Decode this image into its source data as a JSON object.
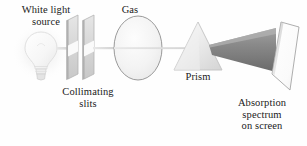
{
  "figure": {
    "background_color": "#fefefe",
    "text_color": "#1a1a1a"
  },
  "labels": {
    "white_light_source": "White light\nsource",
    "gas": "Gas",
    "collimating_slits": "Collimating\nslits",
    "prism": "Prism",
    "absorption_spectrum_on_screen": "Absorption\nspectrum\non screen"
  },
  "components": {
    "light_bulb": {
      "name": "light-bulb",
      "fill": "#f7f7f7",
      "stroke": "#d8d8d8",
      "glow_color": "#f2f2f2"
    },
    "collimating_slits": {
      "name": "collimating-slits",
      "plate_count": 2,
      "face_fill": "#dcdcdc",
      "edge_fill": "#bdbdbd",
      "stroke": "#b0b0b0"
    },
    "gas_cell": {
      "name": "gas-cell",
      "shape": "ellipse",
      "fill": "#f4f4f4",
      "stroke": "#8f8f8f"
    },
    "prism": {
      "name": "prism",
      "shape": "triangle",
      "fill": "#e2e2e2",
      "stroke": "#c6c6c6"
    },
    "beam": {
      "name": "light-beam",
      "color": "#dedede",
      "stroke": "#c9c9c9"
    },
    "dispersed_beam": {
      "name": "dispersed-beam",
      "color_top": "#9a9a9a",
      "color_bottom": "#6e6e6e"
    },
    "screen": {
      "name": "projection-screen",
      "fill": "#fbfbfb",
      "stroke": "#a5a5a5"
    }
  }
}
